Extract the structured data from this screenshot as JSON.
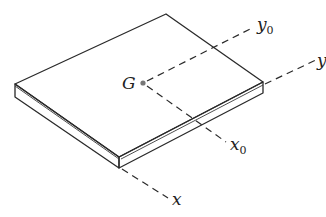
{
  "diagram": {
    "point": {
      "label": "G"
    },
    "axes": [
      {
        "id": "y0",
        "label": "y",
        "subscript": "0"
      },
      {
        "id": "y",
        "label": "y",
        "subscript": ""
      },
      {
        "id": "x0",
        "label": "x",
        "subscript": "0"
      },
      {
        "id": "x",
        "label": "x",
        "subscript": ""
      }
    ],
    "colors": {
      "line": "#2a2a2a",
      "point": "#777777",
      "background": "#ffffff"
    }
  }
}
